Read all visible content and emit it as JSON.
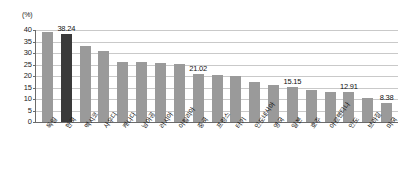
{
  "chart_data": {
    "type": "bar",
    "title": "",
    "subtitle": "",
    "xlabel": "",
    "ylabel": "",
    "unit_label": "(%)",
    "ylim": [
      0,
      40
    ],
    "yticks": [
      0,
      5,
      10,
      15,
      20,
      25,
      30,
      35,
      40
    ],
    "grid": true,
    "legend": "none",
    "highlight_color": "#3a3a3a",
    "bar_color": "#9a9a9a",
    "highlight_category": "한국",
    "categories": [
      "독일",
      "한국",
      "멕시코",
      "사우디",
      "캐나다",
      "남아공",
      "러시아",
      "이탈리아",
      "중국",
      "프랑스",
      "터키",
      "인도네시아",
      "영국",
      "일본",
      "호주",
      "아르헨티나",
      "인도",
      "브라질",
      "미국"
    ],
    "values": [
      39.3,
      38.24,
      32.9,
      31.0,
      26.0,
      26.0,
      25.5,
      25.4,
      21.02,
      20.5,
      20.0,
      17.4,
      16.1,
      15.15,
      14.0,
      12.9,
      12.91,
      10.3,
      8.38
    ],
    "value_labels": [
      "",
      "38.24",
      "",
      "",
      "",
      "",
      "",
      "",
      "21.02",
      "",
      "",
      "",
      "",
      "15.15",
      "",
      "",
      "12.91",
      "",
      "8.38"
    ]
  }
}
